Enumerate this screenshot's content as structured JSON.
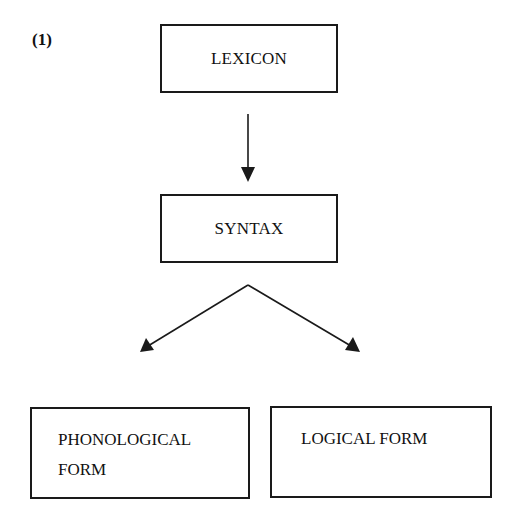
{
  "figure": {
    "number_label": "(1)",
    "nodes": {
      "lexicon": "LEXICON",
      "syntax": "SYNTAX",
      "phonological_form": {
        "line1": "PHONOLOGICAL",
        "line2": "FORM"
      },
      "logical_form": "LOGICAL FORM"
    },
    "edges": [
      {
        "from": "LEXICON",
        "to": "SYNTAX"
      },
      {
        "from": "SYNTAX",
        "to": "PHONOLOGICAL FORM"
      },
      {
        "from": "SYNTAX",
        "to": "LOGICAL FORM"
      }
    ],
    "colors": {
      "stroke": "#1a1a1a",
      "background": "#ffffff"
    }
  }
}
